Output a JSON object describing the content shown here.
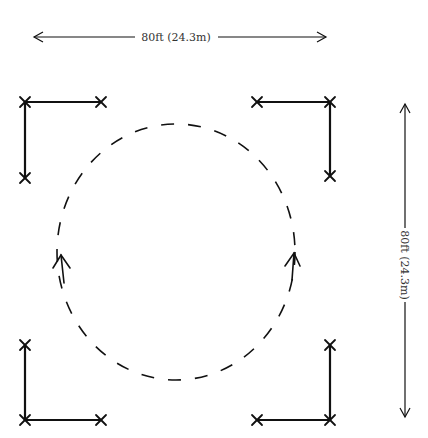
{
  "diagram": {
    "type": "stage-layout",
    "colors": {
      "stroke": "#111111",
      "text": "#333333",
      "background": "#ffffff"
    },
    "dimensions": {
      "width_label": "80ft (24.3m)",
      "height_label": "80ft (24.3m)"
    },
    "corner_markers": [
      {
        "name": "top-left",
        "corner": [
          25,
          102
        ],
        "ends": [
          [
            101,
            102
          ],
          [
            25,
            178
          ]
        ]
      },
      {
        "name": "top-right",
        "corner": [
          330,
          102
        ],
        "ends": [
          [
            257,
            102
          ],
          [
            330,
            176
          ]
        ]
      },
      {
        "name": "bottom-left",
        "corner": [
          25,
          420
        ],
        "ends": [
          [
            101,
            420
          ],
          [
            25,
            345
          ]
        ]
      },
      {
        "name": "bottom-right",
        "corner": [
          330,
          420
        ],
        "ends": [
          [
            257,
            420
          ],
          [
            330,
            345
          ]
        ]
      }
    ],
    "circle": {
      "cx": 176,
      "cy": 252,
      "r": 125,
      "style": "dashed",
      "direction_arrows": [
        "left-side-up",
        "right-side-up"
      ]
    }
  }
}
